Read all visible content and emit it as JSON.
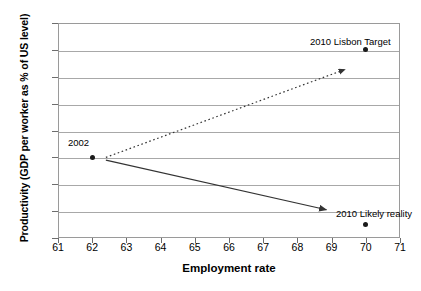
{
  "chart_data": {
    "type": "scatter",
    "title": "",
    "xlabel": "Employment rate",
    "ylabel": "Productivity (GDP per worker as % of US level)",
    "xlim": [
      61,
      71
    ],
    "ylim": [
      86,
      102
    ],
    "xticks": [
      61,
      62,
      63,
      64,
      65,
      66,
      67,
      68,
      69,
      70,
      71
    ],
    "yticks": [
      86,
      88,
      90,
      92,
      94,
      96,
      98,
      100,
      102
    ],
    "grid": "horizontal",
    "legend": "none",
    "points": [
      {
        "label": "2002",
        "x": 62,
        "y": 92
      },
      {
        "label": "2010 Lisbon Target",
        "x": 70,
        "y": 100
      },
      {
        "label": "2010 Likely reality",
        "x": 70,
        "y": 87
      }
    ],
    "arrows": [
      {
        "name": "lisbon-target-trajectory",
        "style": "dotted",
        "from": {
          "x": 62.4,
          "y": 92
        },
        "to": {
          "x": 69.4,
          "y": 98.55
        }
      },
      {
        "name": "likely-reality-trajectory",
        "style": "solid",
        "from": {
          "x": 62.4,
          "y": 91.8
        },
        "to": {
          "x": 68.85,
          "y": 88.1
        }
      }
    ],
    "annotations": [
      {
        "text": "2002",
        "x": 62,
        "y": 93.4
      },
      {
        "text": "2010 Lisbon Target",
        "x": 70,
        "y": 101.4
      },
      {
        "text": "2010 Likely reality",
        "x": 70,
        "y": 88.2
      }
    ],
    "colors": {
      "marker": "#1a1a1a",
      "gridline": "#a8a8a8",
      "axis": "#9a9a9a",
      "line": "#333333",
      "background": "#ffffff"
    }
  }
}
